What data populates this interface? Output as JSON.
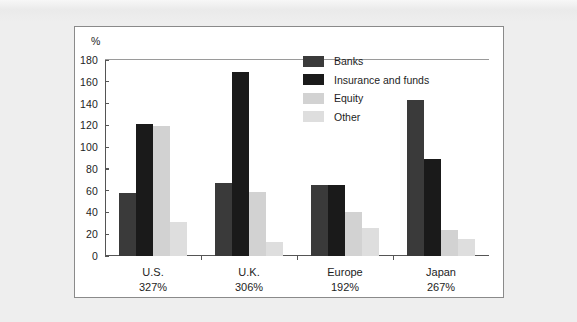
{
  "chart_data": {
    "type": "bar",
    "title": "",
    "subtitle": "",
    "xlabel": "",
    "ylabel": "%",
    "unit_label": "%",
    "ylim": [
      0,
      180
    ],
    "yticks": [
      0,
      20,
      40,
      60,
      80,
      100,
      120,
      140,
      160,
      180
    ],
    "grid": false,
    "legend_position": "top-right",
    "categories": [
      "U.S.",
      "U.K.",
      "Europe",
      "Japan"
    ],
    "category_totals": [
      "327%",
      "306%",
      "192%",
      "267%"
    ],
    "category_labels": [
      {
        "name": "U.S.",
        "total": "327%"
      },
      {
        "name": "U.K.",
        "total": "306%"
      },
      {
        "name": "Europe",
        "total": "192%"
      },
      {
        "name": "Japan",
        "total": "267%"
      }
    ],
    "series": [
      {
        "name": "Banks",
        "color": "#3a3a3a",
        "values": [
          58,
          67,
          65,
          143
        ]
      },
      {
        "name": "Insurance and funds",
        "color": "#1a1a1a",
        "values": [
          121,
          169,
          65,
          89
        ]
      },
      {
        "name": "Equity",
        "color": "#d2d2d2",
        "values": [
          119,
          59,
          40,
          24
        ]
      },
      {
        "name": "Other",
        "color": "#dedede",
        "values": [
          31,
          13,
          26,
          16
        ]
      }
    ]
  },
  "colors": {
    "banks": "#3a3a3a",
    "insurance_and_funds": "#1a1a1a",
    "equity": "#d2d2d2",
    "other": "#dedede",
    "panel_background": "#ffffff",
    "figure_background": "#eeeeee",
    "axis": "#555555",
    "text": "#1d1d1d"
  },
  "legend": {
    "items": [
      {
        "label": "Banks",
        "color": "#3a3a3a"
      },
      {
        "label": "Insurance and funds",
        "color": "#1a1a1a"
      },
      {
        "label": "Equity",
        "color": "#d2d2d2"
      },
      {
        "label": "Other",
        "color": "#dedede"
      }
    ]
  },
  "yticks": [
    {
      "label": "180"
    },
    {
      "label": "160"
    },
    {
      "label": "140"
    },
    {
      "label": "120"
    },
    {
      "label": "100"
    },
    {
      "label": "80"
    },
    {
      "label": "60"
    },
    {
      "label": "40"
    },
    {
      "label": "20"
    },
    {
      "label": "0"
    }
  ]
}
